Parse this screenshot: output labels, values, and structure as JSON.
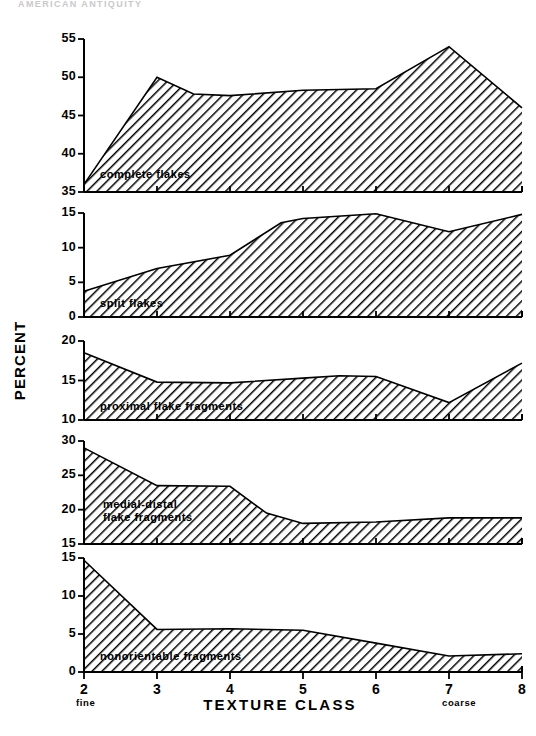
{
  "header": {
    "running_text": "AMERICAN ANTIQUITY"
  },
  "figure": {
    "y_axis_title": "PERCENT",
    "x_axis_title": "TEXTURE  CLASS",
    "x_left_end_label": "fine",
    "x_right_end_label": "coarse",
    "x_tick_labels": [
      "2",
      "3",
      "4",
      "5",
      "6",
      "7",
      "8"
    ],
    "ink_color": "#000000",
    "background_color": "#ffffff"
  },
  "chart_data": {
    "type": "area",
    "title": "",
    "xlabel": "TEXTURE CLASS",
    "ylabel": "PERCENT",
    "x": [
      2,
      3,
      4,
      5,
      6,
      7,
      8
    ],
    "xlim": [
      2,
      8
    ],
    "grid": false,
    "legend": "inline-labels",
    "shared_x_axis": true,
    "fill_pattern": "diagonal-hatch",
    "panels": [
      {
        "index": 1,
        "name": "complete flakes",
        "label": "complete flakes",
        "ylim": [
          35,
          55
        ],
        "yticks": [
          35,
          40,
          45,
          50,
          55
        ],
        "ytick_labels": [
          "35",
          "40",
          "45",
          "50",
          "55"
        ],
        "values": [
          36,
          50,
          47.8,
          47.6,
          48.3,
          48.5,
          54,
          46
        ],
        "values_at_x": {
          "2": 36,
          "3": 50,
          "3.5": 47.8,
          "4": 47.6,
          "5": 48.3,
          "6": 48.5,
          "7": 54,
          "8": 46
        }
      },
      {
        "index": 2,
        "name": "split flakes",
        "label": "split flakes",
        "ylim": [
          0,
          15
        ],
        "yticks": [
          0,
          5,
          10,
          15
        ],
        "ytick_labels": [
          "0",
          "5",
          "10",
          "15"
        ],
        "values": [
          3.7,
          7.0,
          8.9,
          13.6,
          14.2,
          14.9,
          12.3,
          14.8
        ],
        "values_at_x": {
          "2": 3.7,
          "3": 7.0,
          "4": 8.9,
          "4.7": 13.6,
          "5": 14.2,
          "6": 14.9,
          "7": 12.3,
          "8": 14.8
        }
      },
      {
        "index": 3,
        "name": "proximal flake fragments",
        "label": "proximal flake fragments",
        "ylim": [
          10,
          20
        ],
        "yticks": [
          10,
          15,
          20
        ],
        "ytick_labels": [
          "10",
          "15",
          "20"
        ],
        "values": [
          18.5,
          14.8,
          14.7,
          15.3,
          15.6,
          15.5,
          12.2,
          17.2
        ],
        "values_at_x": {
          "2": 18.5,
          "3": 14.8,
          "4": 14.7,
          "5": 15.3,
          "5.5": 15.6,
          "6": 15.5,
          "7": 12.2,
          "8": 17.2
        }
      },
      {
        "index": 4,
        "name": "medial-distal flake fragments",
        "label": "medial-distal",
        "label_line2": "flake fragments",
        "ylim": [
          15,
          30
        ],
        "yticks": [
          15,
          20,
          25,
          30
        ],
        "ytick_labels": [
          "15",
          "20",
          "25",
          "30"
        ],
        "values": [
          29,
          23.5,
          23.4,
          19.5,
          18,
          18.2,
          18.8,
          18.8
        ],
        "values_at_x": {
          "2": 29,
          "3": 23.5,
          "4": 23.4,
          "4.5": 19.5,
          "5": 18,
          "6": 18.2,
          "7": 18.8,
          "8": 18.8
        }
      },
      {
        "index": 5,
        "name": "nonorientable fragments",
        "label": "nonorientable fragments",
        "ylim": [
          0,
          15
        ],
        "yticks": [
          0,
          5,
          10,
          15
        ],
        "ytick_labels": [
          "0",
          "5",
          "10",
          "15"
        ],
        "values": [
          14.7,
          5.6,
          5.7,
          5.5,
          3.8,
          2.1,
          2.4
        ],
        "values_at_x": {
          "2": 14.7,
          "3": 5.6,
          "4": 5.7,
          "5": 5.5,
          "6": 3.8,
          "7": 2.1,
          "8": 2.4
        }
      }
    ]
  }
}
